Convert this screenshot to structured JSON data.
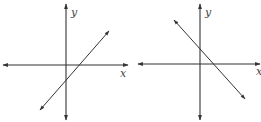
{
  "graphs": [
    {
      "id": "left",
      "x_label": "x",
      "y_label": "y",
      "line_slope": "positive",
      "axes": {
        "origin": [
          66,
          65
        ],
        "x_range": [
          3,
          128
        ],
        "y_range": [
          4,
          120
        ]
      },
      "line": {
        "from": [
          40,
          110
        ],
        "to": [
          109,
          31
        ]
      }
    },
    {
      "id": "right",
      "x_label": "x",
      "y_label": "y",
      "line_slope": "negative",
      "axes": {
        "origin": [
          200,
          64
        ],
        "x_range": [
          138,
          260
        ],
        "y_range": [
          4,
          120
        ]
      },
      "line": {
        "from": [
          174,
          20
        ],
        "to": [
          245,
          99
        ]
      }
    }
  ],
  "colors": {
    "stroke": "#333333",
    "label": "#444444"
  }
}
